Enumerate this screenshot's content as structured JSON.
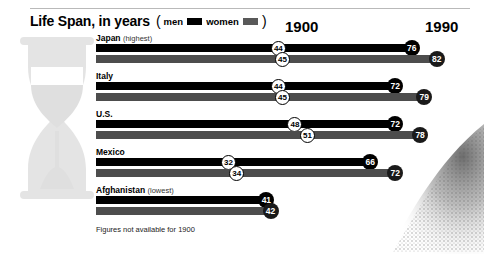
{
  "header": {
    "title": "Life Span, in years",
    "legend": {
      "open_paren": "(",
      "men_label": "men",
      "women_label": "women",
      "close_paren": ")",
      "men_color": "#000000",
      "women_color": "#595959"
    }
  },
  "columns": {
    "year_1900": "1900",
    "year_1990": "1990"
  },
  "footnote": "Figures not available for 1900",
  "chart_data": {
    "type": "bar",
    "title": "Life Span, in years",
    "xlabel": "",
    "ylabel": "",
    "xlim": [
      0,
      90
    ],
    "grid": false,
    "legend_position": "title-inline",
    "categories": [
      "Japan",
      "Italy",
      "U.S.",
      "Mexico",
      "Afghanistan"
    ],
    "category_notes": [
      "(highest)",
      "",
      "",
      "",
      "(lowest)"
    ],
    "series": [
      {
        "name": "men 1900",
        "values": [
          44,
          44,
          48,
          32,
          null
        ]
      },
      {
        "name": "men 1990",
        "values": [
          76,
          72,
          72,
          66,
          41
        ]
      },
      {
        "name": "women 1900",
        "values": [
          45,
          45,
          51,
          34,
          null
        ]
      },
      {
        "name": "women 1990",
        "values": [
          82,
          79,
          78,
          72,
          42
        ]
      }
    ],
    "annotations": [
      "Figures not available for 1900"
    ]
  },
  "rows": [
    {
      "name": "Japan",
      "note": "(highest)",
      "men": {
        "v1900": "44",
        "v1990": "76"
      },
      "women": {
        "v1900": "45",
        "v1990": "82"
      }
    },
    {
      "name": "Italy",
      "note": "",
      "men": {
        "v1900": "44",
        "v1990": "72"
      },
      "women": {
        "v1900": "45",
        "v1990": "79"
      }
    },
    {
      "name": "U.S.",
      "note": "",
      "men": {
        "v1900": "48",
        "v1990": "72"
      },
      "women": {
        "v1900": "51",
        "v1990": "78"
      }
    },
    {
      "name": "Mexico",
      "note": "",
      "men": {
        "v1900": "32",
        "v1990": "66"
      },
      "women": {
        "v1900": "34",
        "v1990": "72"
      }
    },
    {
      "name": "Afghanistan",
      "note": "(lowest)",
      "men": {
        "v1900": "",
        "v1990": "41"
      },
      "women": {
        "v1900": "",
        "v1990": "42"
      }
    }
  ]
}
